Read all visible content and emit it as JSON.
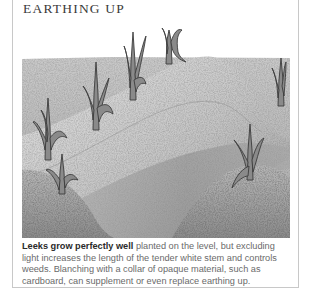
{
  "section": {
    "heading": "EARTHING UP"
  },
  "illustration": {
    "subject": "leeks-earthed-up-ridges",
    "leek_count": 7,
    "style": "grayscale stippled drawing"
  },
  "caption": {
    "lead": "Leeks grow perfectly well",
    "body": " planted on the level, but excluding light increases the length of the tender white stem and controls weeds. Blanching with a collar of opaque material, such as cardboard, can supplement or even replace earthing up."
  },
  "colors": {
    "heading_text": "#3a3a3a",
    "body_text": "#6a6a6a",
    "lead_text": "#2a2a2a",
    "border": "#c8c8c8"
  }
}
